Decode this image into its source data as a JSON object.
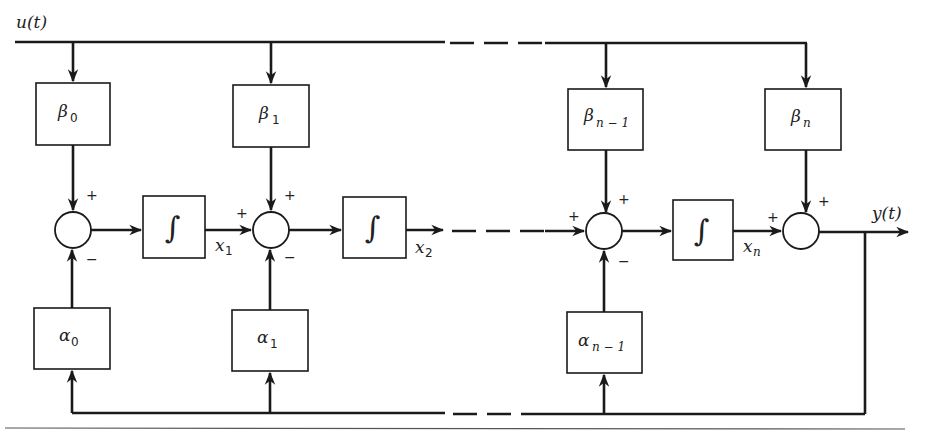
{
  "diagram": {
    "input_label": "u(t)",
    "output_label": "y(t)",
    "beta_blocks": [
      {
        "symbol": "β",
        "subscript": "0"
      },
      {
        "symbol": "β",
        "subscript": "1"
      },
      {
        "symbol": "β",
        "subscript": "n − 1"
      },
      {
        "symbol": "β",
        "subscript": "n"
      }
    ],
    "alpha_blocks": [
      {
        "symbol": "α",
        "subscript": "0"
      },
      {
        "symbol": "α",
        "subscript": "1"
      },
      {
        "symbol": "α",
        "subscript": "n − 1"
      }
    ],
    "integrators": [
      {
        "symbol": "∫",
        "state": "x",
        "state_sub": "1"
      },
      {
        "symbol": "∫",
        "state": "x",
        "state_sub": "2"
      },
      {
        "symbol": "∫",
        "state": "x",
        "state_sub": "n"
      }
    ],
    "summing_junctions": [
      {
        "top_sign": "+",
        "left_sign": "",
        "bottom_sign": "−"
      },
      {
        "top_sign": "+",
        "left_sign": "+",
        "bottom_sign": "−"
      },
      {
        "top_sign": "+",
        "left_sign": "+",
        "bottom_sign": "−"
      },
      {
        "top_sign": "+",
        "left_sign": "+",
        "bottom_sign": ""
      }
    ],
    "colors": {
      "line": "#1a1a1a",
      "background": "#ffffff"
    }
  }
}
